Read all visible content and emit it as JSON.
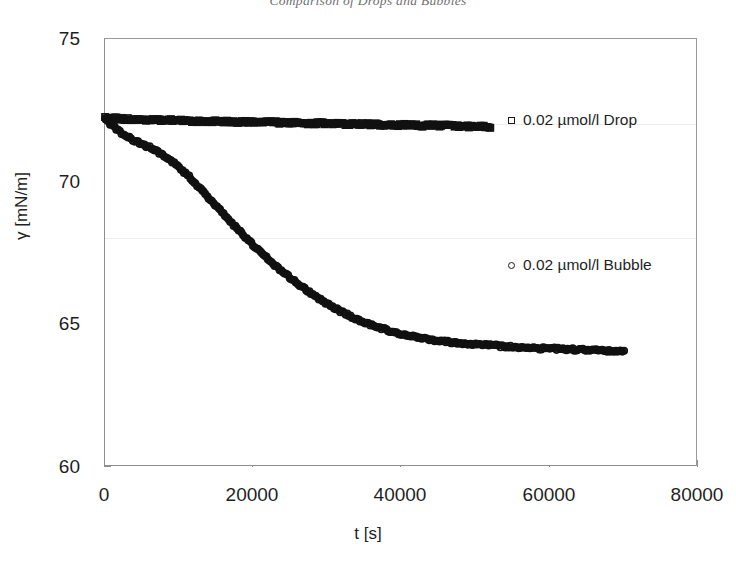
{
  "chart_data": {
    "type": "scatter",
    "title": "Comparison of Drops and Bubbles",
    "xlabel": "t [s]",
    "ylabel": "γ [mN/m]",
    "xlim": [
      0,
      80000
    ],
    "ylim": [
      60,
      75
    ],
    "xticks": [
      "0",
      "20000",
      "40000",
      "60000",
      "80000"
    ],
    "yticks": [
      "60",
      "65",
      "70",
      "75"
    ],
    "xtick_values": [
      0,
      20000,
      40000,
      60000,
      80000
    ],
    "ytick_values": [
      60,
      65,
      70,
      75
    ],
    "grid": "faint horizontal gridlines at 68 and 72",
    "legend_position": "inside right",
    "series": [
      {
        "name": "0.02 µmol/l Drop",
        "marker": "square",
        "color": "#111111",
        "x": [
          0,
          1000,
          2000,
          3000,
          4000,
          5000,
          6000,
          7000,
          8000,
          9000,
          10000,
          11000,
          12000,
          13000,
          14000,
          15000,
          16000,
          17000,
          18000,
          19000,
          20000,
          21000,
          22000,
          23000,
          24000,
          25000,
          26000,
          27000,
          28000,
          29000,
          30000,
          31000,
          32000,
          33000,
          34000,
          35000,
          36000,
          37000,
          38000,
          39000,
          40000,
          41000,
          42000,
          43000,
          44000,
          45000,
          46000,
          47000,
          48000,
          49000,
          50000,
          51000,
          52000
        ],
        "y": [
          72.25,
          72.22,
          72.2,
          72.19,
          72.18,
          72.17,
          72.16,
          72.16,
          72.15,
          72.15,
          72.14,
          72.13,
          72.13,
          72.12,
          72.12,
          72.11,
          72.11,
          72.1,
          72.1,
          72.09,
          72.09,
          72.08,
          72.08,
          72.07,
          72.07,
          72.06,
          72.06,
          72.05,
          72.05,
          72.04,
          72.04,
          72.03,
          72.03,
          72.02,
          72.02,
          72.01,
          72.01,
          72.0,
          72.0,
          71.99,
          71.99,
          71.98,
          71.98,
          71.97,
          71.97,
          71.96,
          71.96,
          71.95,
          71.95,
          71.94,
          71.94,
          71.93,
          71.92
        ]
      },
      {
        "name": "0.02 µmol/l Bubble",
        "marker": "circle",
        "color": "#111111",
        "x": [
          0,
          1000,
          2000,
          3000,
          4000,
          5000,
          6000,
          7000,
          8000,
          9000,
          10000,
          11000,
          12000,
          13000,
          14000,
          15000,
          16000,
          17000,
          18000,
          19000,
          20000,
          21000,
          22000,
          23000,
          24000,
          25000,
          26000,
          27000,
          28000,
          29000,
          30000,
          31000,
          32000,
          33000,
          34000,
          35000,
          36000,
          37000,
          38000,
          39000,
          40000,
          41000,
          42000,
          43000,
          44000,
          45000,
          46000,
          47000,
          48000,
          49000,
          50000,
          51000,
          52000,
          53000,
          54000,
          55000,
          56000,
          57000,
          58000,
          59000,
          60000,
          61000,
          62000,
          63000,
          64000,
          65000,
          66000,
          67000,
          68000,
          69000,
          70000
        ],
        "y": [
          72.2,
          71.95,
          71.75,
          71.58,
          71.44,
          71.32,
          71.2,
          71.06,
          70.9,
          70.72,
          70.5,
          70.26,
          70.0,
          69.72,
          69.44,
          69.15,
          68.86,
          68.58,
          68.3,
          68.03,
          67.77,
          67.52,
          67.28,
          67.05,
          66.83,
          66.62,
          66.42,
          66.23,
          66.05,
          65.88,
          65.72,
          65.57,
          65.43,
          65.3,
          65.18,
          65.07,
          64.97,
          64.88,
          64.8,
          64.73,
          64.67,
          64.61,
          64.56,
          64.51,
          64.47,
          64.43,
          64.4,
          64.37,
          64.34,
          64.32,
          64.3,
          64.28,
          64.26,
          64.24,
          64.23,
          64.21,
          64.2,
          64.19,
          64.17,
          64.16,
          64.15,
          64.14,
          64.13,
          64.12,
          64.11,
          64.1,
          64.09,
          64.08,
          64.07,
          64.06,
          64.05
        ]
      }
    ]
  },
  "legend": {
    "drop": "0.02 µmol/l Drop",
    "bubble": "0.02 µmol/l Bubble"
  }
}
